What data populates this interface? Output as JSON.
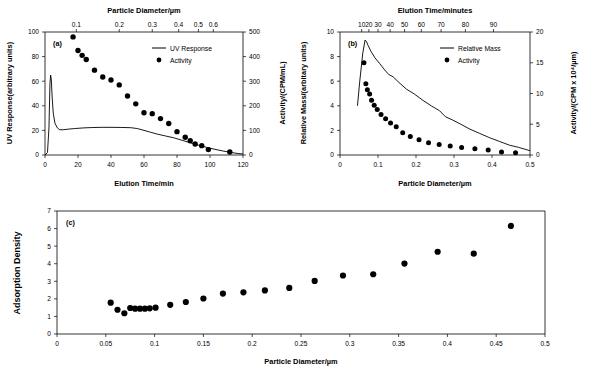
{
  "figure": {
    "background": "#ffffff",
    "marker_color": "#000000",
    "line_color": "#000000"
  },
  "chart_data": [
    {
      "id": "panel-a",
      "type": "line",
      "tag": "(a)",
      "title": "",
      "xlabel": "Elution Time/min",
      "ylabel": "UV Response(arbitrary units)",
      "y2label": "Activity/(CPM/mL)",
      "x2label": "Particle Diameter/µm",
      "xlim": [
        0,
        120
      ],
      "ylim": [
        0,
        100
      ],
      "y2lim": [
        0,
        500
      ],
      "xticks": [
        0,
        20,
        40,
        60,
        80,
        100,
        120
      ],
      "yticks": [
        0,
        20,
        40,
        60,
        80,
        100
      ],
      "y2ticks": [
        0,
        100,
        200,
        300,
        400,
        500
      ],
      "x2ticks": [
        {
          "label": "0.1",
          "x": 19
        },
        {
          "label": "0.2",
          "x": 45
        },
        {
          "label": "0.3",
          "x": 65
        },
        {
          "label": "0.4",
          "x": 81
        },
        {
          "label": "0.5",
          "x": 93
        },
        {
          "label": "0.6",
          "x": 102
        }
      ],
      "grid": false,
      "legend_position": "upper-center",
      "series": [
        {
          "name": "UV Response",
          "marker": "line",
          "axis": "left",
          "x": [
            0,
            1.5,
            2.4,
            3.0,
            3.4,
            3.8,
            4.3,
            5.0,
            6.0,
            7.5,
            9.0,
            11,
            14,
            18,
            23,
            28,
            34,
            40,
            46,
            52,
            56,
            60,
            64,
            68,
            73,
            78,
            83,
            88,
            93,
            98,
            103,
            108,
            113,
            117,
            120
          ],
          "y": [
            0,
            2,
            22,
            58,
            65,
            62,
            48,
            34,
            26,
            22,
            20.5,
            20.5,
            21,
            21.5,
            22,
            22.3,
            22.5,
            22.5,
            22.4,
            22.2,
            21.5,
            20,
            18.5,
            17,
            15.5,
            14,
            12,
            10,
            8,
            6.2,
            4.6,
            3.2,
            2,
            1.2,
            0.8
          ]
        },
        {
          "name": "Activity",
          "marker": "circle",
          "axis": "right",
          "x": [
            17,
            20,
            22.5,
            25,
            30,
            35,
            40,
            45,
            50,
            55,
            60,
            65,
            70,
            75,
            80,
            85,
            88,
            91,
            95,
            99,
            112
          ],
          "y": [
            480,
            425,
            405,
            388,
            345,
            317,
            305,
            285,
            240,
            208,
            172,
            168,
            148,
            128,
            95,
            72,
            58,
            45,
            38,
            22,
            12
          ]
        }
      ]
    },
    {
      "id": "panel-b",
      "type": "line",
      "tag": "(b)",
      "title": "",
      "xlabel": "Particle Diameter/µm",
      "ylabel": "Relative Mass/(arbitary units)",
      "y2label": "Activity/(CPM x 10⁴/µm)",
      "x2label": "Elution Time/minutes",
      "xlim": [
        0,
        0.5
      ],
      "ylim": [
        0,
        10
      ],
      "y2lim": [
        0,
        20
      ],
      "xticks": [
        0,
        0.1,
        0.2,
        0.3,
        0.4,
        0.5
      ],
      "yticks": [
        0,
        2,
        4,
        6,
        8,
        10
      ],
      "y2ticks": [
        0,
        5,
        10,
        15,
        20
      ],
      "x2ticks": [
        {
          "label": "10",
          "x": 0.057
        },
        {
          "label": "20",
          "x": 0.076
        },
        {
          "label": "30",
          "x": 0.1
        },
        {
          "label": "40",
          "x": 0.132
        },
        {
          "label": "50",
          "x": 0.17
        },
        {
          "label": "60",
          "x": 0.214
        },
        {
          "label": "70",
          "x": 0.266
        },
        {
          "label": "80",
          "x": 0.33
        },
        {
          "label": "90",
          "x": 0.404
        }
      ],
      "grid": false,
      "legend_position": "upper-right",
      "series": [
        {
          "name": "Relative Mass",
          "marker": "line",
          "axis": "left",
          "x": [
            0.046,
            0.052,
            0.06,
            0.066,
            0.07,
            0.074,
            0.082,
            0.092,
            0.104,
            0.118,
            0.128,
            0.14,
            0.155,
            0.175,
            0.196,
            0.218,
            0.24,
            0.262,
            0.278,
            0.296,
            0.318,
            0.342,
            0.368,
            0.394,
            0.42,
            0.446,
            0.47,
            0.5
          ],
          "y": [
            4.0,
            6.0,
            8.3,
            9.35,
            9.2,
            8.9,
            8.4,
            7.9,
            7.45,
            6.9,
            6.55,
            6.35,
            5.9,
            5.35,
            4.95,
            4.45,
            4.0,
            3.6,
            3.1,
            2.85,
            2.5,
            2.1,
            1.75,
            1.4,
            1.1,
            0.8,
            0.62,
            0.35
          ]
        },
        {
          "name": "Activity",
          "marker": "circle",
          "axis": "right",
          "x": [
            0.063,
            0.068,
            0.072,
            0.078,
            0.083,
            0.09,
            0.098,
            0.108,
            0.12,
            0.133,
            0.148,
            0.165,
            0.185,
            0.208,
            0.233,
            0.261,
            0.29,
            0.32,
            0.355,
            0.39,
            0.425,
            0.462
          ],
          "y": [
            15.0,
            11.6,
            10.6,
            9.9,
            8.9,
            8.1,
            7.4,
            6.6,
            5.9,
            5.2,
            4.6,
            3.6,
            3.0,
            2.5,
            2.0,
            1.7,
            1.45,
            1.2,
            1.0,
            0.8,
            0.5,
            0.35
          ]
        }
      ]
    },
    {
      "id": "panel-c",
      "type": "scatter",
      "tag": "(c)",
      "title": "",
      "xlabel": "Particle Diameter/µm",
      "ylabel": "Adsorption Density",
      "xlim": [
        0,
        0.5
      ],
      "ylim": [
        0,
        7
      ],
      "xticks": [
        0,
        0.05,
        0.1,
        0.15,
        0.2,
        0.25,
        0.3,
        0.35,
        0.4,
        0.45,
        0.5
      ],
      "yticks": [
        0,
        1,
        2,
        3,
        4,
        5,
        6,
        7
      ],
      "grid": false,
      "series": [
        {
          "name": "Adsorption Density",
          "marker": "circle",
          "x": [
            0.055,
            0.062,
            0.069,
            0.075,
            0.08,
            0.085,
            0.09,
            0.095,
            0.101,
            0.116,
            0.132,
            0.15,
            0.17,
            0.191,
            0.213,
            0.238,
            0.264,
            0.293,
            0.324,
            0.356,
            0.39,
            0.427,
            0.465
          ],
          "y": [
            1.78,
            1.38,
            1.18,
            1.48,
            1.44,
            1.44,
            1.44,
            1.46,
            1.5,
            1.66,
            1.82,
            2.02,
            2.3,
            2.37,
            2.48,
            2.62,
            3.02,
            3.33,
            3.4,
            4.01,
            4.68,
            4.57,
            6.15
          ]
        }
      ]
    }
  ]
}
